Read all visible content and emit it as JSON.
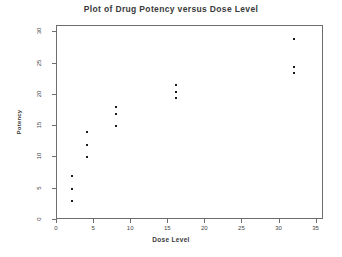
{
  "chart_data": {
    "type": "scatter",
    "title": "Plot of Drug Potency versus Dose Level",
    "xlabel": "Dose Level",
    "ylabel": "Potency",
    "xlim": [
      0,
      36
    ],
    "ylim": [
      0,
      31
    ],
    "xticks": [
      0,
      5,
      10,
      15,
      20,
      25,
      30,
      35
    ],
    "yticks": [
      0,
      5,
      10,
      15,
      20,
      25,
      30
    ],
    "grid": false,
    "legend": null,
    "marker": "square",
    "marker_color": "#1c1c1c",
    "points": [
      {
        "x": 2,
        "y": 3
      },
      {
        "x": 2,
        "y": 5
      },
      {
        "x": 2,
        "y": 7
      },
      {
        "x": 4,
        "y": 10
      },
      {
        "x": 4,
        "y": 12
      },
      {
        "x": 4,
        "y": 14
      },
      {
        "x": 8,
        "y": 15
      },
      {
        "x": 8,
        "y": 17
      },
      {
        "x": 8,
        "y": 18
      },
      {
        "x": 16,
        "y": 19.5
      },
      {
        "x": 16,
        "y": 20.5
      },
      {
        "x": 16,
        "y": 21.5
      },
      {
        "x": 32,
        "y": 23.5
      },
      {
        "x": 32,
        "y": 24.5
      },
      {
        "x": 32,
        "y": 29
      }
    ]
  }
}
